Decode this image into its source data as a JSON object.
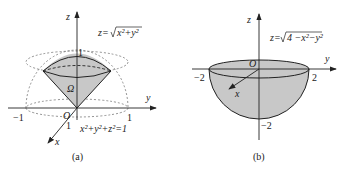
{
  "panel_a": {
    "caption": "(a)",
    "axis_z": "z",
    "axis_y": "y",
    "axis_x": "x",
    "origin": "O",
    "region": "Ω",
    "tick_z_1": "1",
    "tick_y_neg1": "−1",
    "tick_y_1": "1",
    "tick_x_1": "1",
    "cone_eq_lhs": "z=",
    "cone_eq_rad": "x²+y²",
    "sphere_eq": "x²+y²+z²=1"
  },
  "panel_b": {
    "caption": "(b)",
    "axis_z": "z",
    "axis_y": "y",
    "axis_x": "x",
    "origin": "O",
    "tick_y_neg2": "−2",
    "tick_y_2": "2",
    "tick_z_neg2": "−2",
    "eq_lhs": "z=",
    "eq_rad": "4 −x²−y²"
  },
  "colors": {
    "fill": "#c8c8c8",
    "line": "#222222"
  }
}
